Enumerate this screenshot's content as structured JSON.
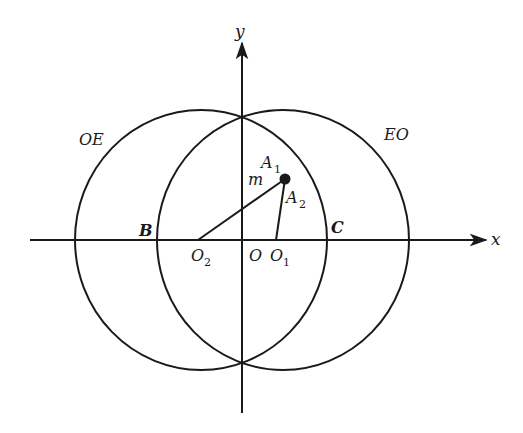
{
  "figure": {
    "background": "#ffffff",
    "stroke_color": "#1a1a1a",
    "axes": {
      "x": {
        "label": "x",
        "from": [
          30,
          240
        ],
        "to": [
          486,
          240
        ]
      },
      "y": {
        "label": "y",
        "from": [
          242,
          413
        ],
        "to": [
          242,
          43
        ]
      }
    },
    "circles": [
      {
        "name": "OE",
        "label": "OE",
        "center_label": "O",
        "center_sub": "2",
        "cx": 201,
        "cy": 240,
        "rx": 126,
        "ry": 130
      },
      {
        "name": "EO",
        "label": "EO",
        "center_label": "O",
        "center_sub": "1",
        "cx": 283,
        "cy": 240,
        "rx": 126,
        "ry": 130
      }
    ],
    "point_A1": {
      "label": "A",
      "sub": "1",
      "x": 285,
      "y": 179
    },
    "segments": [
      {
        "name": "O2-A1",
        "label": "m",
        "from": [
          198,
          240
        ],
        "to": [
          285,
          179
        ]
      },
      {
        "name": "O1-A1",
        "label": "A",
        "label_sub": "2",
        "from": [
          276,
          240
        ],
        "to": [
          285,
          179
        ]
      }
    ],
    "labels": {
      "origin": "O",
      "B": "B",
      "C": "C",
      "OE": "OE",
      "EO": "EO",
      "m": "m",
      "A": "A",
      "A1_sub": "1",
      "A2_sub": "2",
      "O": "O",
      "O1_sub": "1",
      "O2_sub": "2",
      "x": "x",
      "y": "y"
    }
  }
}
